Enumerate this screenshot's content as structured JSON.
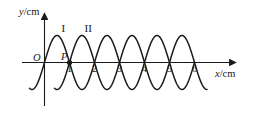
{
  "figure": {
    "axes": {
      "y_axis_label": "y/cm",
      "y_axis_label_var": "y",
      "y_axis_label_unit": "/cm",
      "x_axis_label": "x/cm",
      "x_axis_label_var": "x",
      "x_axis_label_unit": "/cm",
      "origin_label": "O"
    },
    "x_ticks": [
      {
        "label": "1",
        "value": 1
      },
      {
        "label": "2",
        "value": 2
      },
      {
        "label": "3",
        "value": 3
      },
      {
        "label": "4",
        "value": 4
      },
      {
        "label": "5",
        "value": 5
      },
      {
        "label": "6",
        "value": 6
      }
    ],
    "points": [
      {
        "label": "P",
        "x": 1,
        "y": 0
      }
    ],
    "curve_labels": [
      {
        "label": "I",
        "x": 0.75
      },
      {
        "label": "II",
        "x": 1.75
      }
    ],
    "stroke_color": "#1a1a1a"
  },
  "chart_data": {
    "type": "line",
    "title": "",
    "xlabel": "x/cm",
    "ylabel": "y/cm",
    "xlim": [
      -0.6,
      7.0
    ],
    "ylim": [
      -1.15,
      1.15
    ],
    "grid": false,
    "legend": "inline-curve-labels",
    "annotations": [
      {
        "text": "I",
        "x": 0.75,
        "y": 1.15,
        "note": "label for wave I above its first crest"
      },
      {
        "text": "II",
        "x": 1.75,
        "y": 1.15,
        "note": "label for wave II above its first crest"
      },
      {
        "text": "P",
        "x": 1.0,
        "y": 0.0,
        "note": "marked dot on x-axis at x = 1 cm"
      },
      {
        "text": "O",
        "x": 0.0,
        "y": 0.0,
        "note": "origin label, left of y-axis"
      }
    ],
    "series": [
      {
        "name": "I",
        "wave": "sine",
        "amplitude": 1,
        "wavelength": 2,
        "phase_zero_up_at_x": 0,
        "x_start": -0.6,
        "x_end": 6.0,
        "crests_x": [
          0.5,
          2.5,
          4.5
        ],
        "troughs_x": [
          -0.5,
          1.5,
          3.5,
          5.5
        ],
        "zero_crossings_x": [
          0,
          1,
          2,
          3,
          4,
          5,
          6
        ]
      },
      {
        "name": "II",
        "wave": "sine",
        "amplitude": 1,
        "wavelength": 2,
        "phase_zero_up_at_x": 1,
        "x_start": 0.4,
        "x_end": 6.5,
        "crests_x": [
          1.5,
          3.5,
          5.5
        ],
        "troughs_x": [
          0.5,
          2.5,
          4.5,
          6.5
        ],
        "zero_crossings_x": [
          1,
          2,
          3,
          4,
          5,
          6
        ]
      }
    ]
  }
}
